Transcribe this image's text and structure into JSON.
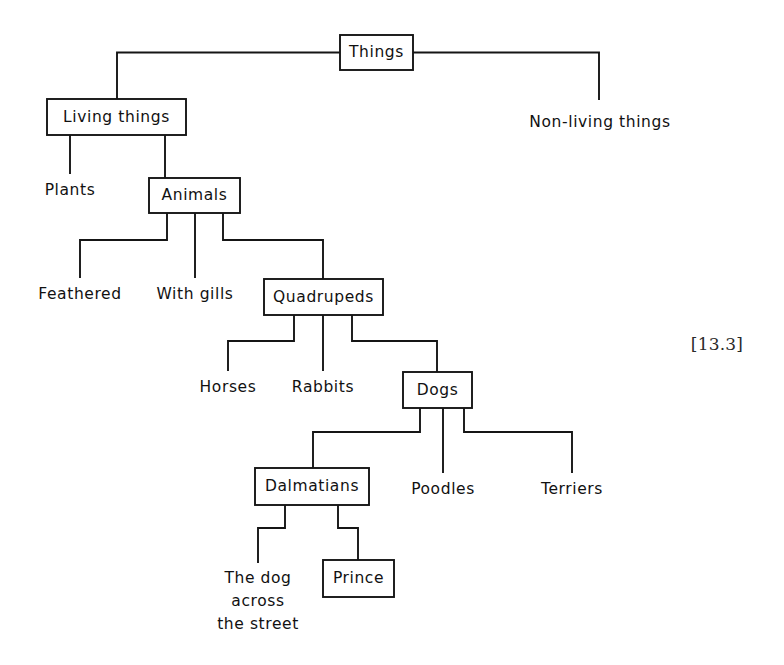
{
  "figure": {
    "reference_label": "[13.3]",
    "reference_x": 717,
    "reference_y": 345,
    "background_color": "#ffffff",
    "line_color": "#151515",
    "text_color": "#111111"
  },
  "nodes": {
    "things": {
      "label": "Things",
      "shape": "box",
      "x": 340,
      "y": 35,
      "w": 73,
      "h": 35,
      "cx": 376.5,
      "cy": 52.5
    },
    "living_things": {
      "label": "Living things",
      "shape": "box",
      "x": 47,
      "y": 99,
      "w": 139,
      "h": 36,
      "cx": 116.5,
      "cy": 117
    },
    "non_living_things": {
      "label": "Non-living things",
      "shape": "text",
      "cx": 600,
      "cy": 122
    },
    "plants": {
      "label": "Plants",
      "shape": "text",
      "cx": 70,
      "cy": 190
    },
    "animals": {
      "label": "Animals",
      "shape": "box",
      "x": 149,
      "y": 178,
      "w": 91,
      "h": 35,
      "cx": 194.5,
      "cy": 195.5
    },
    "feathered": {
      "label": "Feathered",
      "shape": "text",
      "cx": 80,
      "cy": 294
    },
    "with_gills": {
      "label": "With gills",
      "shape": "text",
      "cx": 195,
      "cy": 294
    },
    "quadrupeds": {
      "label": "Quadrupeds",
      "shape": "box",
      "x": 264,
      "y": 279,
      "w": 119,
      "h": 36,
      "cx": 323.5,
      "cy": 297
    },
    "horses": {
      "label": "Horses",
      "shape": "text",
      "cx": 228,
      "cy": 387
    },
    "rabbits": {
      "label": "Rabbits",
      "shape": "text",
      "cx": 323,
      "cy": 387
    },
    "dogs": {
      "label": "Dogs",
      "shape": "box",
      "x": 403,
      "y": 372,
      "w": 69,
      "h": 36,
      "cx": 437.5,
      "cy": 390
    },
    "dalmatians": {
      "label": "Dalmatians",
      "shape": "box",
      "x": 255,
      "y": 468,
      "w": 114,
      "h": 37,
      "cx": 312,
      "cy": 486.5
    },
    "poodles": {
      "label": "Poodles",
      "shape": "text",
      "cx": 443,
      "cy": 489
    },
    "terriers": {
      "label": "Terriers",
      "shape": "text",
      "cx": 572,
      "cy": 489
    },
    "the_dog_across_the_street": {
      "label_lines": [
        "The dog",
        "across",
        "the street"
      ],
      "shape": "text",
      "cx": 258,
      "line_y": [
        578,
        601,
        624
      ]
    },
    "prince": {
      "label": "Prince",
      "shape": "box",
      "x": 323,
      "y": 560,
      "w": 71,
      "h": 37,
      "cx": 358.5,
      "cy": 578.5
    }
  },
  "edges": [
    {
      "name": "things-to-living-things",
      "path": "M 340 52.5 L 117 52.5 L 117 99"
    },
    {
      "name": "things-to-non-living-things",
      "path": "M 413 52.5 L 599 52.5 L 599 99"
    },
    {
      "name": "living-things-to-plants",
      "path": "M 70 135 L 70 173"
    },
    {
      "name": "living-things-to-animals",
      "path": "M 165 135 L 165 178"
    },
    {
      "name": "animals-to-feathered",
      "path": "M 167 213 L 167 240 L 80 240 L 80 277"
    },
    {
      "name": "animals-to-with-gills",
      "path": "M 195 213 L 195 277"
    },
    {
      "name": "animals-to-quadrupeds",
      "path": "M 223 213 L 223 240 L 323 240 L 323 279"
    },
    {
      "name": "quadrupeds-to-horses",
      "path": "M 294 315 L 294 341 L 228 341 L 228 370"
    },
    {
      "name": "quadrupeds-to-rabbits",
      "path": "M 323 315 L 323 370"
    },
    {
      "name": "quadrupeds-to-dogs",
      "path": "M 352 315 L 352 341 L 437 341 L 437 372"
    },
    {
      "name": "dogs-to-dalmatians",
      "path": "M 420 408 L 420 432 L 313 432 L 313 468"
    },
    {
      "name": "dogs-to-poodles",
      "path": "M 443 408 L 443 472"
    },
    {
      "name": "dogs-to-terriers",
      "path": "M 464 408 L 464 432 L 572 432 L 572 472"
    },
    {
      "name": "dalmatians-to-the-dog",
      "path": "M 285 505 L 285 528 L 258 528 L 258 562"
    },
    {
      "name": "dalmatians-to-prince",
      "path": "M 338 505 L 338 528 L 358 528 L 358 560"
    }
  ]
}
